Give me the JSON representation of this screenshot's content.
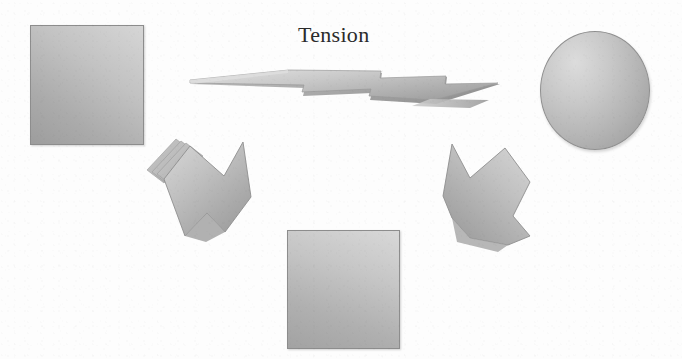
{
  "page": {
    "title": "Tension",
    "background_color": "#fdfdfd",
    "width": 682,
    "height": 359,
    "media": "scanned-figure"
  },
  "labels": {
    "tension": "Tension"
  },
  "palette": {
    "shape_fill_light": "#d8d8d8",
    "shape_fill_mid": "#bdbdbd",
    "shape_fill_dark": "#9d9d9d",
    "outline": "#8d8d8d",
    "text": "#2b2b2b",
    "background": "#fdfdfd"
  },
  "diagram": {
    "type": "conceptual-shape-diagram",
    "nodes": [
      {
        "id": "rect-top-left",
        "shape": "rectangle",
        "label": "",
        "x": 30,
        "y": 25,
        "w": 112,
        "h": 118
      },
      {
        "id": "ellipse-top-right",
        "shape": "ellipse",
        "label": "",
        "x": 540,
        "y": 31,
        "w": 108,
        "h": 117
      },
      {
        "id": "rect-bottom",
        "shape": "rectangle",
        "label": "",
        "x": 287,
        "y": 230,
        "w": 111,
        "h": 117
      }
    ],
    "connectors": [
      {
        "id": "flat-arrow-center",
        "shape": "flattened-3d-arrow",
        "label": "Tension",
        "orientation": "horizontal-perspective"
      },
      {
        "id": "arrow-left",
        "shape": "chevron-block-arrow-3d",
        "direction": "down-right"
      },
      {
        "id": "arrow-right",
        "shape": "chevron-block-arrow-3d",
        "direction": "down-left"
      }
    ]
  },
  "icons": {
    "arrow_left_name": "block-arrow-down-right-icon",
    "arrow_right_name": "block-arrow-down-left-icon",
    "flat_arrow_name": "flat-perspective-arrow-icon"
  }
}
